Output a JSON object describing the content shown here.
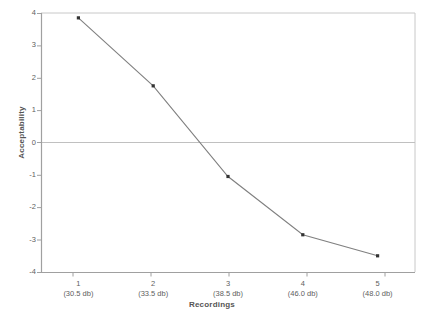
{
  "chart_data": {
    "type": "line",
    "title": "",
    "xlabel": "Recordings",
    "ylabel": "Acceptability",
    "categories": [
      "1",
      "2",
      "3",
      "4",
      "5"
    ],
    "category_sublabels": [
      "(30.5 db)",
      "(33.5 db)",
      "(38.5 db)",
      "(46.0 db)",
      "(48.0 db)"
    ],
    "values": [
      3.85,
      1.75,
      -1.05,
      -2.85,
      -3.5
    ],
    "ylim": [
      -4,
      4
    ],
    "yticks": [
      4,
      3,
      2,
      1,
      0,
      -1,
      -2,
      -3,
      -4
    ],
    "ytick_labels": [
      "4",
      "3",
      "2",
      "1",
      "0",
      "-1",
      "-2",
      "-3",
      "-4"
    ],
    "grid": false,
    "zero_line": true,
    "legend": "none",
    "series": [
      {
        "name": "Acceptability",
        "values": [
          3.85,
          1.75,
          -1.05,
          -2.85,
          -3.5
        ],
        "line_color": "#808080",
        "marker_color": "#333333",
        "marker": "square"
      }
    ]
  },
  "colors": {
    "axis": "#a8a8a8",
    "zero_line": "#c0c0c0",
    "plot_border": "#c8c8c8",
    "tick_text": "#606060",
    "title_text": "#555555",
    "line": "#808080",
    "marker": "#333333",
    "background": "#ffffff"
  },
  "caption_partial": ""
}
